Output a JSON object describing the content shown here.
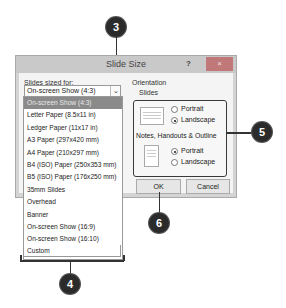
{
  "dialog": {
    "title": "Slide Size",
    "help_label": "?",
    "close_label": "×",
    "slides_sized_for_label": "Slides sized for:",
    "combo_value": "On-screen Show (4:3)",
    "combo_arrow": "⌄",
    "dropdown_options": [
      "On-screen Show (4:3)",
      "Letter Paper (8.5x11 in)",
      "Ledger Paper (11x17 in)",
      "A3 Paper (297x420 mm)",
      "A4 Paper (210x297 mm)",
      "B4 (ISO) Paper (250x353 mm)",
      "B5 (ISO) Paper (176x250 mm)",
      "35mm Slides",
      "Overhead",
      "Banner",
      "On-screen Show (16:9)",
      "On-screen Show (16:10)",
      "Widescreen",
      "Custom"
    ],
    "selected_index": 0,
    "orientation_label": "Orientation",
    "slides_label": "Slides",
    "slides_portrait": "Portrait",
    "slides_landscape": "Landscape",
    "slides_selected": "Landscape",
    "notes_label": "Notes, Handouts & Outline",
    "notes_portrait": "Portrait",
    "notes_landscape": "Landscape",
    "notes_selected": "Portrait",
    "ok_label": "OK",
    "cancel_label": "Cancel"
  },
  "callouts": {
    "c3": "3",
    "c4": "4",
    "c5": "5",
    "c6": "6"
  },
  "colors": {
    "callout_bg": "#2b2b2b",
    "close_button": "#c07878",
    "selected_item": "#8a8a8a"
  }
}
